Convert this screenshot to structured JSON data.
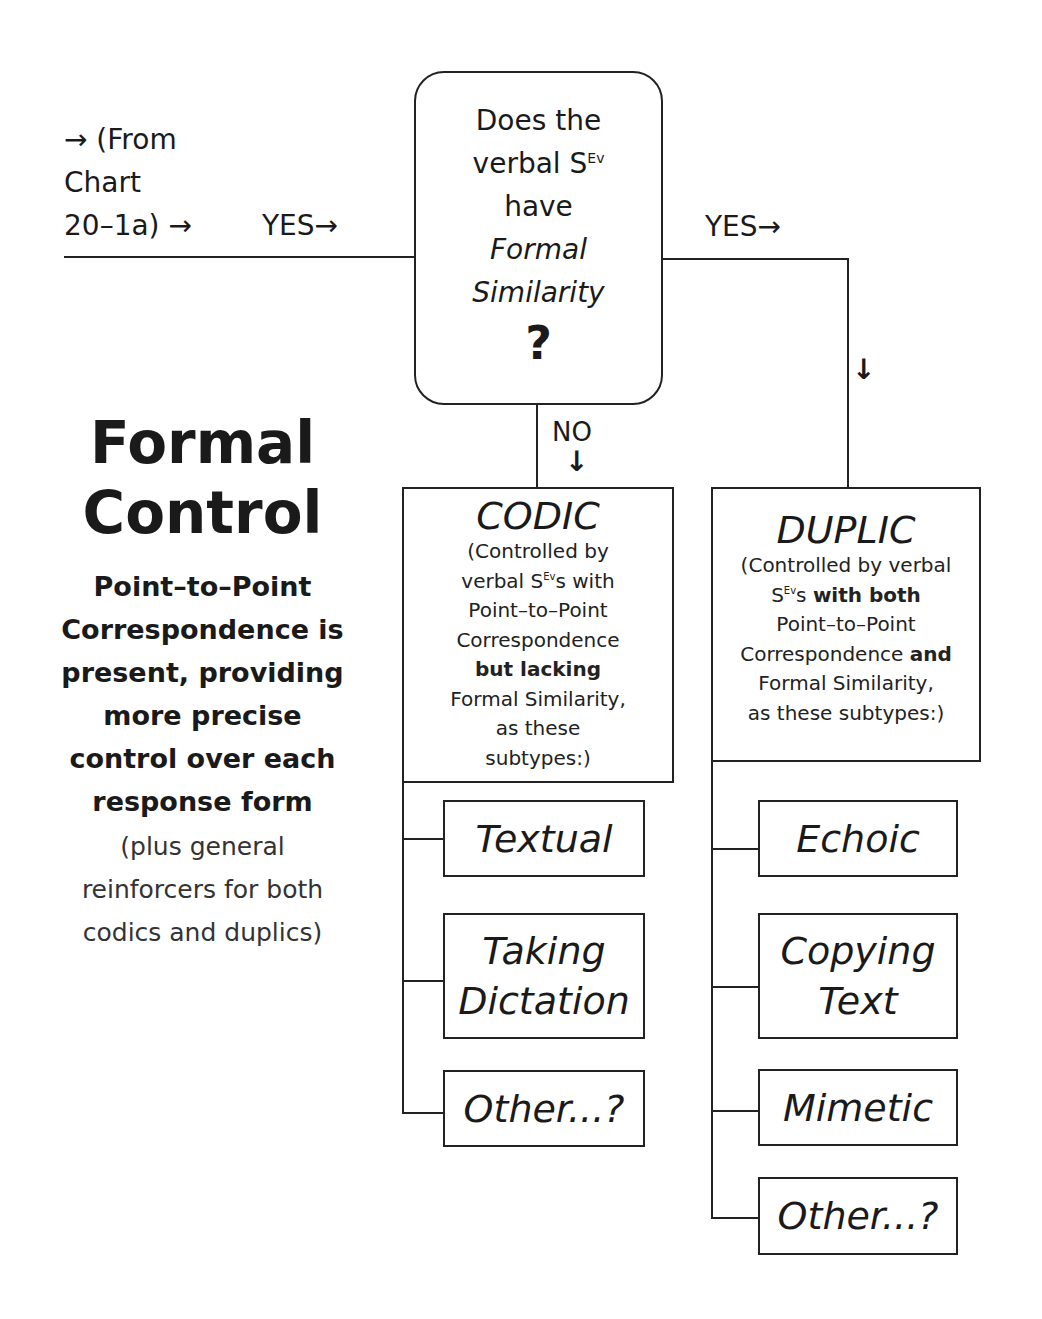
{
  "entry": {
    "from_lines": [
      "→ (From",
      "Chart",
      "20–1a) →"
    ],
    "yes_left": "YES→"
  },
  "question": {
    "line1": "Does the",
    "line2_pre": "verbal S",
    "line2_sup": "Ev",
    "line3": "have",
    "line4": "Formal",
    "line5": "Similarity",
    "mark": "?"
  },
  "branches": {
    "yes_right": "YES→",
    "no_label": "NO",
    "down_arrow": "↓"
  },
  "side": {
    "title_lines": [
      "Formal",
      "Control"
    ],
    "body_lines": [
      "Point–to–Point",
      "Correspondence is",
      "present, providing",
      "more precise",
      "control over each",
      "response form"
    ],
    "note_lines": [
      "(plus general",
      "reinforcers for both",
      "codics and duplics)"
    ]
  },
  "codic": {
    "title": "CODIC",
    "desc": {
      "l1": "(Controlled by",
      "l2_pre": "verbal S",
      "l2_sup": "Ev",
      "l2_post": "s with",
      "l3": "Point–to–Point",
      "l4": "Correspondence",
      "l5_bold": "but lacking",
      "l6": "Formal Similarity,",
      "l7": "as these",
      "l8": "subtypes:)"
    },
    "subtypes": [
      {
        "lines": [
          "Textual"
        ]
      },
      {
        "lines": [
          "Taking",
          "Dictation"
        ]
      },
      {
        "lines": [
          "Other...?"
        ]
      }
    ]
  },
  "duplic": {
    "title": "DUPLIC",
    "desc": {
      "l1": "(Controlled by verbal",
      "l2_pre": "S",
      "l2_sup": "Ev",
      "l2_post": "s ",
      "l2_bold": "with both",
      "l3": "Point–to–Point",
      "l4_pre": "Correspondence ",
      "l4_bold": "and",
      "l5": "Formal Similarity,",
      "l6": "as these subtypes:)"
    },
    "subtypes": [
      {
        "lines": [
          "Echoic"
        ]
      },
      {
        "lines": [
          "Copying",
          "Text"
        ]
      },
      {
        "lines": [
          "Mimetic"
        ]
      },
      {
        "lines": [
          "Other...?"
        ]
      }
    ]
  }
}
